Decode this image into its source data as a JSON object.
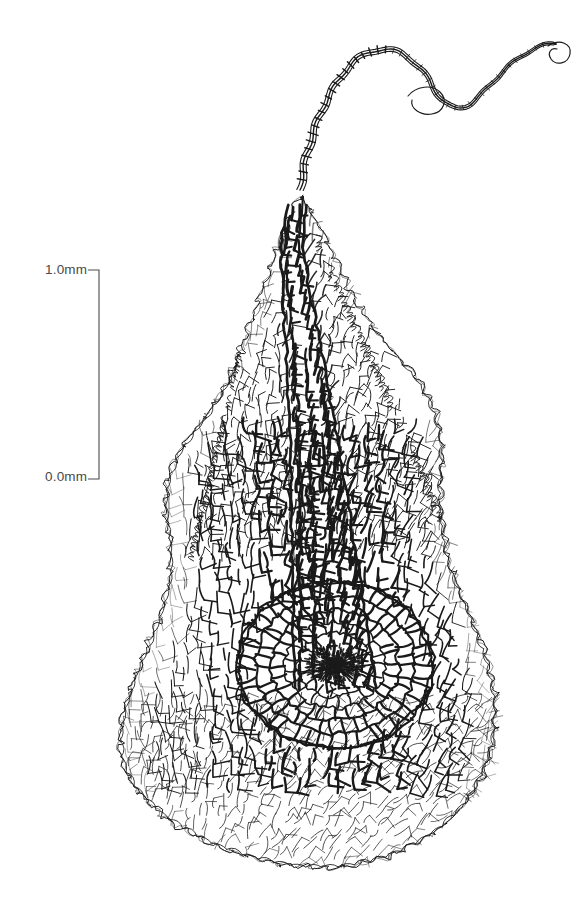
{
  "figure": {
    "kind": "scientific-line-drawing",
    "technique": "ink line drawing",
    "background_color": "#ffffff",
    "ink_color": "#1a1a1a",
    "canvas": {
      "width": 585,
      "height": 905
    }
  },
  "scale_bar": {
    "top_label": "1.0mm",
    "bottom_label": "0.0mm",
    "unit": "mm",
    "span_value": 1.0,
    "color": "#4a4a4a",
    "line_x": 99,
    "top_y": 270,
    "bottom_y": 479,
    "tick_length": 11,
    "tick_direction": "left",
    "stroke_width": 1.1
  },
  "chart_data": {
    "type": "table",
    "title": "",
    "xlabel": "",
    "ylabel": "",
    "categories": [
      "scale span"
    ],
    "values": [
      1.0
    ],
    "annotations": [
      "1.0mm",
      "0.0mm"
    ]
  },
  "drawing": {
    "seed": 20240517,
    "regions": [
      {
        "name": "hair-point-apex",
        "description": "narrow twisted filament arcing up and to the right, terminating in a small hooked loop",
        "stroke_width": 1.15,
        "shade": "light",
        "path": "M 300,190 C 306,150 318,110 340,78 C 356,54 378,44 398,52 C 418,60 428,78 436,92 C 446,108 458,112 470,104 C 484,94 498,74 516,60 C 530,50 544,42 556,44"
      },
      {
        "name": "costa-column",
        "description": "dense dark elongate cells forming central nerve running from apex to rosette",
        "stroke_width": 2.6,
        "shade": "dark"
      },
      {
        "name": "upper-lamina",
        "description": "frilly undulating leaf margin flanking the costa in the upper half",
        "stroke_width": 1.0,
        "shade": "light"
      },
      {
        "name": "mid-body",
        "description": "broad triangular expansion of the leaf blade with large hyaline cells",
        "stroke_width": 1.9,
        "shade": "medium"
      },
      {
        "name": "cell-rosette",
        "description": "radial whorl of cells centred on a small dark insertion point",
        "stroke_width": 2.2,
        "shade": "dark",
        "center_x": 335,
        "center_y": 665,
        "outer_radius": 96,
        "core_radius": 22
      },
      {
        "name": "basal-skirt",
        "description": "wide fan of fine thin-walled cells spreading across the bottom of the leaf",
        "stroke_width": 0.85,
        "shade": "light"
      }
    ],
    "silhouette": "M 300,196 C 282,232 266,276 252,320 C 236,372 216,404 190,436 C 168,464 160,496 168,534 C 176,572 166,604 150,640 C 132,680 118,716 120,748 C 123,784 150,812 196,836 C 244,860 300,872 346,866 C 396,860 440,836 466,802 C 492,768 500,728 494,690 C 488,650 470,616 456,580 C 442,544 438,506 442,470 C 446,430 434,396 408,368 C 382,340 356,306 340,270 C 326,238 314,214 300,196 Z"
  }
}
